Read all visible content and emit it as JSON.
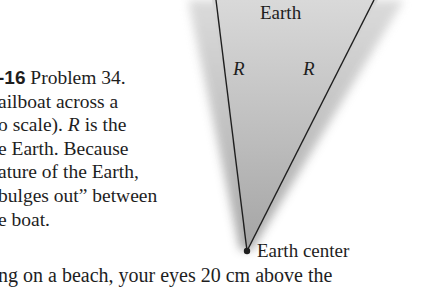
{
  "figure": {
    "labels": {
      "top": "Earth",
      "radius_left": "R",
      "radius_right": "R",
      "center": "Earth center"
    },
    "colors": {
      "wedge_fill": "#a9a9a9",
      "wedge_fill_light": "#d6d6d6",
      "line": "#1e1e1e",
      "text": "#1e1e1e",
      "background": "#ffffff"
    }
  },
  "caption": {
    "figure_number": "-16",
    "lines": [
      "Problem 34.",
      "ailboat across a",
      "o scale).",
      "is the",
      "e Earth. Because",
      "ature of the Earth,",
      "bulges out” between",
      "e boat."
    ],
    "italic_symbol": "R"
  },
  "body_text": {
    "partial_line": "ng on a beach, your eyes 20 cm above the"
  }
}
